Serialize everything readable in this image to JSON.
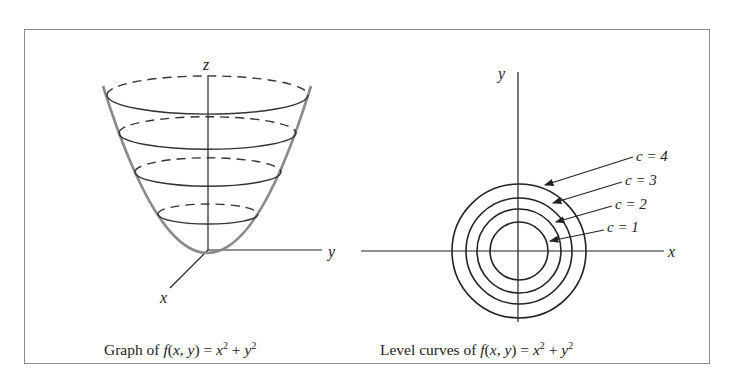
{
  "figure": {
    "left_panel": {
      "title": "Graph of f(x, y) = x^2 + y^2",
      "caption_prefix": "Graph of ",
      "caption_func": "f",
      "caption_args": "(x, y)",
      "caption_eq": " = ",
      "caption_x": "x",
      "caption_y": "y",
      "caption_exp": "2",
      "caption_plus": " + ",
      "axis_labels": {
        "z": "z",
        "y": "y",
        "x": "x"
      }
    },
    "right_panel": {
      "title": "Level curves of f(x, y) = x^2 + y^2",
      "caption_prefix": "Level curves of ",
      "caption_func": "f",
      "caption_args": "(x, y)",
      "caption_eq": " = ",
      "caption_x": "x",
      "caption_y": "y",
      "caption_exp": "2",
      "caption_plus": " + ",
      "axis_labels": {
        "y": "y",
        "x": "x"
      },
      "level_labels": [
        "c = 4",
        "c = 3",
        "c = 2",
        "c = 1"
      ]
    }
  }
}
